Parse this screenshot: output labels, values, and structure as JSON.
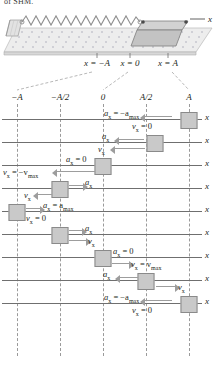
{
  "figure": {
    "heading_fragment": "of SHM.",
    "apparatus": {
      "spring_label": "spring",
      "block_label": "block",
      "track_label": "frictionless-surface",
      "axis_label": "x",
      "position_labels": [
        {
          "text": "x = −A",
          "x": 97
        },
        {
          "text": "x = 0",
          "x": 130
        },
        {
          "text": "x = A",
          "x": 168
        }
      ]
    },
    "axis_ticks": [
      {
        "label": "−A",
        "x": 17
      },
      {
        "label": "−A/2",
        "x": 60
      },
      {
        "label": "0",
        "x": 103
      },
      {
        "label": "A/2",
        "x": 146
      },
      {
        "label": "A",
        "x": 189
      }
    ],
    "guides_x": [
      17,
      60,
      103,
      146,
      189
    ],
    "axis_symbol": "x",
    "rows": [
      {
        "name": "t-0-right-turning-point",
        "block_x": 189,
        "accel": {
          "symbol": "a",
          "sub": "x",
          "value": "= −a",
          "value_sub": "max",
          "direction": "left",
          "label_x": 104,
          "label_y": 1,
          "arrow_x": 145,
          "arrow_w": 27,
          "arrow_y": 8
        },
        "veloc": {
          "symbol": "v",
          "sub": "x",
          "value": "= 0",
          "value_sub": "",
          "direction": "none",
          "label_x": 132,
          "label_y": 14,
          "arrow_x": 0,
          "arrow_w": 0,
          "arrow_y": 0
        }
      },
      {
        "name": "t-1-moving-left-from-A",
        "block_x": 155,
        "accel": {
          "symbol": "a",
          "sub": "x",
          "value": "",
          "value_sub": "",
          "direction": "left",
          "label_x": 102,
          "label_y": 1,
          "arrow_x": 119,
          "arrow_w": 25,
          "arrow_y": 8
        },
        "veloc": {
          "symbol": "v",
          "sub": "x",
          "value": "",
          "value_sub": "",
          "direction": "left",
          "label_x": 98,
          "label_y": 14,
          "arrow_x": 115,
          "arrow_w": 30,
          "arrow_y": 17
        }
      },
      {
        "name": "t-2-through-equilibrium-leftward",
        "block_x": 103,
        "accel": {
          "symbol": "a",
          "sub": "x",
          "value": "= 0",
          "value_sub": "",
          "direction": "none",
          "label_x": 66,
          "label_y": 1,
          "arrow_x": 0,
          "arrow_w": 0,
          "arrow_y": 0
        },
        "veloc": {
          "symbol": "v",
          "sub": "x",
          "value": "= −v",
          "value_sub": "max",
          "direction": "left",
          "label_x": 3,
          "label_y": 14,
          "arrow_x": 57,
          "arrow_w": 38,
          "arrow_y": 17
        }
      },
      {
        "name": "t-3-decelerating-toward-minus-A",
        "block_x": 60,
        "accel": {
          "symbol": "a",
          "sub": "x",
          "value": "",
          "value_sub": "",
          "direction": "right",
          "label_x": 85,
          "label_y": 1,
          "arrow_x": 69,
          "arrow_w": 14,
          "arrow_y": 8
        },
        "veloc": {
          "symbol": "v",
          "sub": "x",
          "value": "",
          "value_sub": "",
          "direction": "left",
          "label_x": 24,
          "label_y": 14,
          "arrow_x": 38,
          "arrow_w": 15,
          "arrow_y": 17
        }
      },
      {
        "name": "t-4-left-turning-point",
        "block_x": 17,
        "accel": {
          "symbol": "a",
          "sub": "x",
          "value": "= a",
          "value_sub": "max",
          "direction": "right",
          "label_x": 43,
          "label_y": 1,
          "arrow_x": 26,
          "arrow_w": 14,
          "arrow_y": 8
        },
        "veloc": {
          "symbol": "v",
          "sub": "x",
          "value": "= 0",
          "value_sub": "",
          "direction": "none",
          "label_x": 26,
          "label_y": 14,
          "arrow_x": 0,
          "arrow_w": 0,
          "arrow_y": 0
        }
      },
      {
        "name": "t-5-moving-right-from-minus-A",
        "block_x": 60,
        "accel": {
          "symbol": "a",
          "sub": "x",
          "value": "",
          "value_sub": "",
          "direction": "right",
          "label_x": 85,
          "label_y": 1,
          "arrow_x": 69,
          "arrow_w": 13,
          "arrow_y": 7
        },
        "veloc": {
          "symbol": "v",
          "sub": "x",
          "value": "",
          "value_sub": "",
          "direction": "right",
          "label_x": 88,
          "label_y": 14,
          "arrow_x": 69,
          "arrow_w": 17,
          "arrow_y": 17
        }
      },
      {
        "name": "t-6-through-equilibrium-rightward",
        "block_x": 103,
        "accel": {
          "symbol": "a",
          "sub": "x",
          "value": "= 0",
          "value_sub": "",
          "direction": "none",
          "label_x": 113,
          "label_y": 1,
          "arrow_x": 0,
          "arrow_w": 0,
          "arrow_y": 0
        },
        "veloc": {
          "symbol": "v",
          "sub": "x",
          "value": "= v",
          "value_sub": "max",
          "direction": "right",
          "label_x": 131,
          "label_y": 14,
          "arrow_x": 112,
          "arrow_w": 17,
          "arrow_y": 17
        }
      },
      {
        "name": "t-7-decelerating-toward-A",
        "block_x": 146,
        "accel": {
          "symbol": "a",
          "sub": "x",
          "value": "",
          "value_sub": "",
          "direction": "left",
          "label_x": 103,
          "label_y": 1,
          "arrow_x": 120,
          "arrow_w": 18,
          "arrow_y": 8
        },
        "veloc": {
          "symbol": "v",
          "sub": "x",
          "value": "",
          "value_sub": "",
          "direction": "right",
          "label_x": 178,
          "label_y": 14,
          "arrow_x": 156,
          "arrow_w": 19,
          "arrow_y": 17
        }
      },
      {
        "name": "t-8-right-turning-point-again",
        "block_x": 189,
        "accel": {
          "symbol": "a",
          "sub": "x",
          "value": "= −a",
          "value_sub": "max",
          "direction": "left",
          "label_x": 104,
          "label_y": 1,
          "arrow_x": 145,
          "arrow_w": 27,
          "arrow_y": 8
        },
        "veloc": {
          "symbol": "v",
          "sub": "x",
          "value": "= 0",
          "value_sub": "",
          "direction": "none",
          "label_x": 132,
          "label_y": 14,
          "arrow_x": 0,
          "arrow_w": 0,
          "arrow_y": 0
        }
      }
    ],
    "row_tops": [
      108,
      131,
      154,
      177,
      200,
      223,
      246,
      269,
      292
    ],
    "colors": {
      "ink": "#231f20",
      "axis": "#6f6f6f",
      "guide": "#9a9a9a",
      "arrow": "#9d9d9d",
      "block_fill": "#c9c9c9",
      "block_stroke": "#8a8a8a",
      "track_fill": "#ededed",
      "spring": "#8f8f8f"
    }
  }
}
